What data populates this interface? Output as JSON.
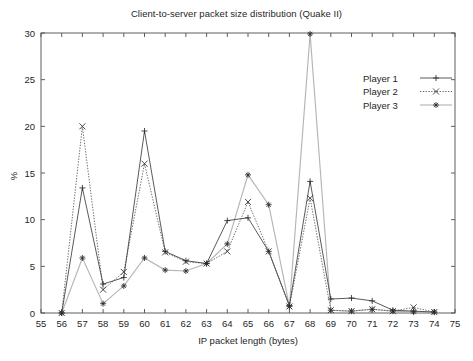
{
  "chart_data": {
    "type": "line",
    "title": "Client-to-server packet size distribution (Quake II)",
    "xlabel": "IP packet length (bytes)",
    "ylabel": "%",
    "xlim": [
      55,
      75
    ],
    "ylim": [
      0,
      30
    ],
    "xticks": [
      55,
      56,
      57,
      58,
      59,
      60,
      61,
      62,
      63,
      64,
      65,
      66,
      67,
      68,
      69,
      70,
      71,
      72,
      73,
      74,
      75
    ],
    "yticks": [
      0,
      5,
      10,
      15,
      20,
      25,
      30
    ],
    "grid": false,
    "legend_position": "top-right",
    "x": [
      56,
      57,
      58,
      59,
      60,
      61,
      62,
      63,
      64,
      65,
      66,
      67,
      68,
      69,
      70,
      71,
      72,
      73,
      74
    ],
    "series": [
      {
        "name": "Player 1",
        "marker": "plus",
        "linestyle": "solid",
        "values": [
          0.0,
          13.4,
          3.1,
          3.8,
          19.5,
          6.6,
          5.6,
          5.3,
          9.9,
          10.2,
          6.6,
          0.8,
          14.1,
          1.5,
          1.6,
          1.3,
          0.3,
          0.2,
          0.1
        ]
      },
      {
        "name": "Player 2",
        "marker": "cross",
        "linestyle": "dotted",
        "values": [
          0.0,
          20.0,
          2.5,
          4.4,
          16.0,
          6.5,
          5.5,
          5.3,
          6.6,
          11.9,
          6.6,
          0.7,
          12.3,
          0.3,
          0.2,
          0.4,
          0.2,
          0.6,
          0.1
        ]
      },
      {
        "name": "Player 3",
        "marker": "star",
        "linestyle": "solid-light",
        "values": [
          0.0,
          5.9,
          1.0,
          2.9,
          5.9,
          4.6,
          4.5,
          5.3,
          7.4,
          14.8,
          11.6,
          0.7,
          29.9,
          0.3,
          0.2,
          0.4,
          0.2,
          0.1,
          0.1
        ]
      }
    ]
  },
  "legend": {
    "entries": [
      {
        "label": "Player 1"
      },
      {
        "label": "Player 2"
      },
      {
        "label": "Player 3"
      }
    ]
  },
  "colors": {
    "frame": "#4d4d4d",
    "series1": "#3c3c3c",
    "series2": "#555555",
    "series3": "#b5b5b5",
    "text": "#262626",
    "background": "#ffffff"
  }
}
